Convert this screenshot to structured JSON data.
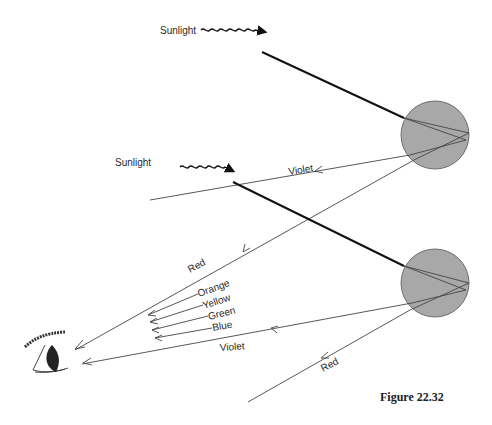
{
  "caption": "Figure 22.32",
  "labels": {
    "sunlight_top": "Sunlight",
    "sunlight_bottom": "Sunlight",
    "violet_top": "Violet",
    "red_top": "Red",
    "orange": "Orange",
    "yellow": "Yellow",
    "green": "Green",
    "blue": "Blue",
    "violet_bottom": "Violet",
    "red_bottom": "Red"
  },
  "drops": [
    {
      "name": "upper-raindrop",
      "cx": 435,
      "cy": 135,
      "r": 34
    },
    {
      "name": "lower-raindrop",
      "cx": 435,
      "cy": 283,
      "r": 34
    }
  ],
  "colors": {
    "drop_fill": "#a8a8a8",
    "drop_stroke": "#6e6e6e",
    "ray": "#444444",
    "sunbeam": "#111111"
  }
}
